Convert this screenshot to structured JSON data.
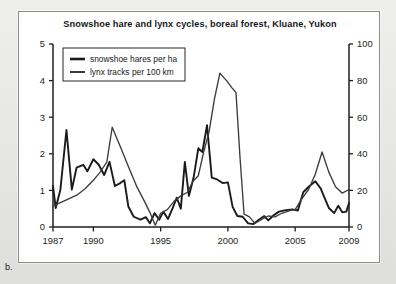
{
  "figure": {
    "panel_letter": "b.",
    "background_color": "#e9e9e9",
    "panel_color": "#ffffff",
    "frame_color": "#8d8d8d"
  },
  "chart_data": {
    "type": "line",
    "title": "Snowshoe hare and lynx cycles, boreal forest, Kluane, Yukon",
    "xlabel": "",
    "ylabel": "",
    "grid": false,
    "legend_position": "top-left",
    "xlim": [
      1987,
      2009
    ],
    "xticks": [
      1987,
      1990,
      1995,
      2000,
      2005,
      2009
    ],
    "xtick_labels": [
      "1987",
      "1990",
      "1995",
      "2000",
      "2005",
      "2009"
    ],
    "left_axis": {
      "label": "snowshoe hares per ha",
      "ylim": [
        0,
        5
      ],
      "yticks": [
        0,
        1,
        2,
        3,
        4,
        5
      ],
      "ytick_labels": [
        "0",
        "1",
        "2",
        "3",
        "4",
        "5"
      ]
    },
    "right_axis": {
      "label": "lynx tracks per 100 km",
      "ylim": [
        0,
        100
      ],
      "yticks": [
        0,
        20,
        40,
        60,
        80,
        100
      ],
      "ytick_labels": [
        "0",
        "20",
        "40",
        "60",
        "80",
        "100"
      ]
    },
    "x": [
      1987,
      1988,
      1989,
      1990,
      1991,
      1992,
      1993,
      1994,
      1995,
      1996,
      1997,
      1998,
      1999,
      2000,
      2001,
      2002,
      2003,
      2004,
      2005,
      2006,
      2007,
      2008,
      2009
    ],
    "series": [
      {
        "name": "snowshoe hares per ha",
        "axis": "left",
        "units": "hares per ha",
        "color": "#1a1a1a",
        "line_width": 1.9,
        "values": [
          1.05,
          2.65,
          1.0,
          1.85,
          1.7,
          1.78,
          1.3,
          0.28,
          0.2,
          0.35,
          0.18,
          0.22,
          0.1,
          0.38,
          0.25,
          0.3,
          0.15,
          0.35,
          0.6,
          0.78,
          0.65,
          0.9,
          0.52
        ]
      },
      {
        "name": "lynx tracks per 100 km",
        "axis": "right",
        "units": "tracks per 100 km",
        "color": "#3b3b3b",
        "line_width": 1.35,
        "values": [
          11,
          13,
          16,
          22,
          30,
          36,
          54,
          41,
          27,
          25,
          20,
          12,
          8,
          4,
          9,
          8,
          11,
          13,
          17,
          19,
          15,
          13,
          10
        ]
      }
    ],
    "detail_series": [
      {
        "name": "snowshoe hares per ha",
        "axis": "left",
        "points": [
          [
            1987.0,
            1.12
          ],
          [
            1987.2,
            0.52
          ],
          [
            1987.55,
            1.02
          ],
          [
            1988.0,
            2.65
          ],
          [
            1988.4,
            1.02
          ],
          [
            1988.75,
            1.62
          ],
          [
            1989.25,
            1.7
          ],
          [
            1989.55,
            1.52
          ],
          [
            1990.0,
            1.85
          ],
          [
            1990.4,
            1.7
          ],
          [
            1990.8,
            1.42
          ],
          [
            1991.2,
            1.78
          ],
          [
            1991.6,
            1.12
          ],
          [
            1992.0,
            1.2
          ],
          [
            1992.3,
            1.28
          ],
          [
            1992.6,
            0.56
          ],
          [
            1993.0,
            0.28
          ],
          [
            1993.5,
            0.2
          ],
          [
            1993.9,
            0.27
          ],
          [
            1994.2,
            0.1
          ],
          [
            1994.55,
            0.38
          ],
          [
            1994.9,
            0.2
          ],
          [
            1995.2,
            0.42
          ],
          [
            1995.55,
            0.22
          ],
          [
            1995.9,
            0.52
          ],
          [
            1996.2,
            0.8
          ],
          [
            1996.5,
            0.5
          ],
          [
            1996.8,
            1.78
          ],
          [
            1997.1,
            0.85
          ],
          [
            1997.45,
            1.35
          ],
          [
            1997.8,
            2.15
          ],
          [
            1998.1,
            2.05
          ],
          [
            1998.45,
            2.78
          ],
          [
            1998.8,
            1.35
          ],
          [
            1999.2,
            1.3
          ],
          [
            1999.6,
            1.2
          ],
          [
            2000.0,
            1.22
          ],
          [
            2000.35,
            0.55
          ],
          [
            2000.7,
            0.3
          ],
          [
            2001.1,
            0.28
          ],
          [
            2001.5,
            0.1
          ],
          [
            2001.9,
            0.08
          ],
          [
            2002.3,
            0.2
          ],
          [
            2002.7,
            0.3
          ],
          [
            2003.0,
            0.18
          ],
          [
            2003.4,
            0.32
          ],
          [
            2003.8,
            0.42
          ],
          [
            2004.3,
            0.46
          ],
          [
            2004.8,
            0.48
          ],
          [
            2005.2,
            0.45
          ],
          [
            2005.6,
            0.95
          ],
          [
            2006.0,
            1.1
          ],
          [
            2006.5,
            1.25
          ],
          [
            2006.9,
            1.05
          ],
          [
            2007.2,
            0.78
          ],
          [
            2007.5,
            0.52
          ],
          [
            2007.9,
            0.38
          ],
          [
            2008.2,
            0.58
          ],
          [
            2008.5,
            0.4
          ],
          [
            2008.8,
            0.42
          ],
          [
            2009.0,
            0.65
          ]
        ]
      },
      {
        "name": "lynx tracks per 100 km",
        "axis": "right",
        "points": [
          [
            1987.0,
            11.5
          ],
          [
            1987.6,
            13.5
          ],
          [
            1988.2,
            15.5
          ],
          [
            1988.8,
            17.5
          ],
          [
            1989.4,
            21.0
          ],
          [
            1990.0,
            25.5
          ],
          [
            1990.5,
            30.0
          ],
          [
            1991.0,
            35.5
          ],
          [
            1991.4,
            54.5
          ],
          [
            1992.0,
            44.0
          ],
          [
            1992.6,
            33.0
          ],
          [
            1993.2,
            22.5
          ],
          [
            1993.8,
            14.0
          ],
          [
            1994.2,
            8.0
          ],
          [
            1994.6,
            1.0
          ],
          [
            1995.0,
            7.5
          ],
          [
            1995.5,
            9.5
          ],
          [
            1996.0,
            14.0
          ],
          [
            1996.5,
            17.0
          ],
          [
            1997.0,
            19.0
          ],
          [
            1997.4,
            25.0
          ],
          [
            1997.8,
            28.0
          ],
          [
            1998.2,
            41.0
          ],
          [
            1998.6,
            52.0
          ],
          [
            1999.0,
            70.0
          ],
          [
            1999.4,
            84.0
          ],
          [
            1999.9,
            80.0
          ],
          [
            2000.3,
            76.0
          ],
          [
            2000.6,
            73.5
          ],
          [
            2000.9,
            38.0
          ],
          [
            2001.2,
            7.0
          ],
          [
            2001.6,
            5.5
          ],
          [
            2002.0,
            2.0
          ],
          [
            2002.6,
            4.5
          ],
          [
            2003.0,
            6.0
          ],
          [
            2003.5,
            5.5
          ],
          [
            2004.0,
            7.5
          ],
          [
            2004.6,
            9.0
          ],
          [
            2005.0,
            9.5
          ],
          [
            2005.5,
            15.5
          ],
          [
            2006.0,
            20.5
          ],
          [
            2006.5,
            29.0
          ],
          [
            2007.0,
            41.0
          ],
          [
            2007.5,
            30.0
          ],
          [
            2008.0,
            22.0
          ],
          [
            2008.5,
            18.5
          ],
          [
            2009.0,
            20.5
          ]
        ]
      }
    ]
  }
}
